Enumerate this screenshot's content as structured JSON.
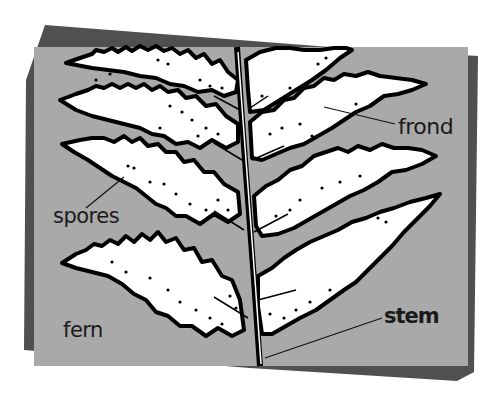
{
  "diagram": {
    "subject": "fern",
    "labels": {
      "frond": "frond",
      "spores": "spores",
      "fern": "fern",
      "stem": "stem"
    },
    "colors": {
      "background": "#ffffff",
      "card_front": "#a9a9a9",
      "card_back": "#505050",
      "leaf_fill": "#ffffff",
      "outline": "#000000",
      "text": "#1a1a1a"
    }
  }
}
